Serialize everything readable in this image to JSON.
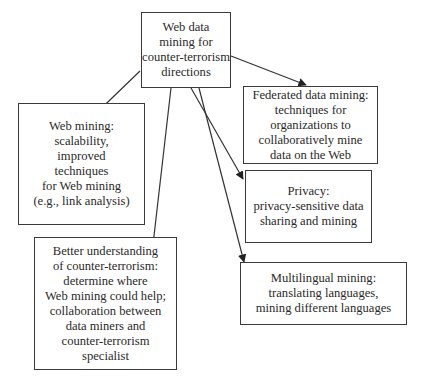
{
  "diagram": {
    "root": {
      "id": "root",
      "text": "Web data\nmining for\ncounter-terrorism\ndirections"
    },
    "children": [
      {
        "id": "web-mining",
        "text": "Web mining:\nscalability,\nimproved\ntechniques\nfor Web mining\n(e.g., link analysis)"
      },
      {
        "id": "better-understanding",
        "text": "Better understanding\nof counter-terrorism:\ndetermine where\nWeb mining could help;\ncollaboration between\ndata miners and\ncounter-terrorism\nspecialist"
      },
      {
        "id": "federated",
        "text": "Federated data mining:\ntechniques for\norganizations to\ncollaboratively mine\ndata on the Web"
      },
      {
        "id": "privacy",
        "text": "Privacy:\nprivacy-sensitive data\nsharing and mining"
      },
      {
        "id": "multilingual",
        "text": "Multilingual mining:\ntranslating languages,\nmining different languages"
      }
    ],
    "edges": [
      {
        "from": "root",
        "to": "web-mining"
      },
      {
        "from": "root",
        "to": "better-understanding"
      },
      {
        "from": "root",
        "to": "federated"
      },
      {
        "from": "root",
        "to": "privacy"
      },
      {
        "from": "root",
        "to": "multilingual"
      }
    ]
  }
}
